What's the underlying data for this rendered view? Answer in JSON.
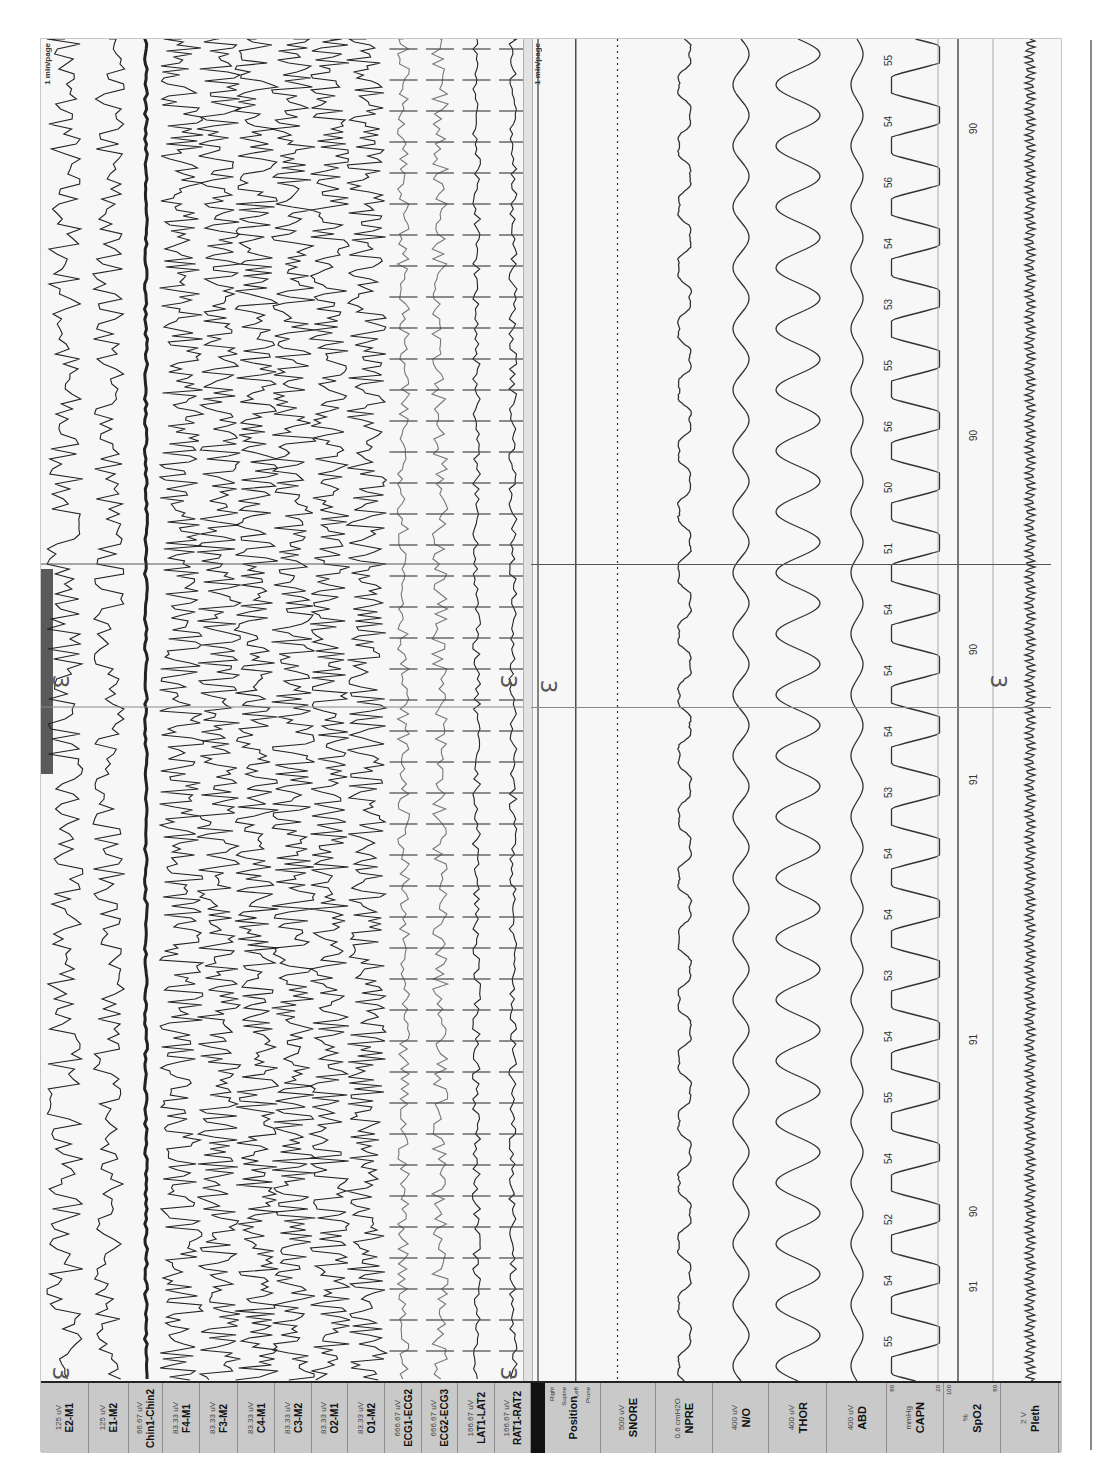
{
  "window": {
    "page_scale_eeg": "1 min/page",
    "page_scale_resp": "1 min/page",
    "cursor_label": ""
  },
  "sleep_stage_markers": [
    "3",
    "3",
    "3",
    "3",
    "3",
    "3"
  ],
  "eeg_channels": [
    {
      "name": "E2-M1",
      "scale": "125 uV"
    },
    {
      "name": "E1-M2",
      "scale": "125 uV"
    },
    {
      "name": "Chin1-Chin2",
      "scale": "66.67 uV"
    },
    {
      "name": "F4-M1",
      "scale": "83.33 uV"
    },
    {
      "name": "F3-M2",
      "scale": "83.33 uV"
    },
    {
      "name": "C4-M1",
      "scale": "83.33 uV"
    },
    {
      "name": "C3-M2",
      "scale": "83.33 uV"
    },
    {
      "name": "O2-M1",
      "scale": "83.33 uV"
    },
    {
      "name": "O1-M2",
      "scale": "83.33 uV"
    },
    {
      "name": "ECG1-ECG2",
      "scale": "666.67 uV"
    },
    {
      "name": "ECG2-ECG3",
      "scale": "666.67 uV"
    },
    {
      "name": "LAT1-LAT2",
      "scale": "166.67 uV"
    },
    {
      "name": "RAT1-RAT2",
      "scale": "166.67 uV"
    }
  ],
  "resp_channels": [
    {
      "name": "Position",
      "scale": "",
      "ticks": [
        "Right",
        "Supine",
        "Left",
        "Prone"
      ]
    },
    {
      "name": "SNORE",
      "scale": "500 uV"
    },
    {
      "name": "NPRE",
      "scale": "0.6 cmH2O"
    },
    {
      "name": "N/O",
      "scale": "400 uV"
    },
    {
      "name": "THOR",
      "scale": "400 uV"
    },
    {
      "name": "ABD",
      "scale": "400 uV"
    },
    {
      "name": "CAPN",
      "scale": "mmHg",
      "range": [
        "80",
        "20"
      ]
    },
    {
      "name": "SpO2",
      "scale": "%",
      "range": [
        "100",
        "80"
      ]
    },
    {
      "name": "Pleth",
      "scale": "2 V"
    }
  ],
  "capn_values": [
    "55",
    "54",
    "56",
    "54",
    "53",
    "55",
    "56",
    "50",
    "51",
    "54",
    "54",
    "54",
    "53",
    "54",
    "54",
    "53",
    "54",
    "55",
    "54",
    "52",
    "54",
    "55"
  ],
  "spo2_values": [
    "90",
    "90",
    "90",
    "91",
    "91",
    "90",
    "91"
  ],
  "colors": {
    "trace": "#222222",
    "label_bg": "#c9c9c9",
    "panel_bg": "#f7f7f7",
    "position_bar": "#111111"
  }
}
